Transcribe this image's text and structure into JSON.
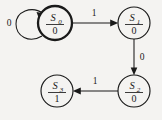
{
  "diagram": {
    "kind": "state-transition-diagram",
    "background_color": "#f4f3f1",
    "line_color": "#1a1a1a",
    "states": [
      {
        "id": "S0",
        "name": "S",
        "subscript": "0",
        "output": "0",
        "cx": 55,
        "cy": 23,
        "r": 17,
        "emphasis": "bold"
      },
      {
        "id": "S1",
        "name": "S",
        "subscript": "1",
        "output": "0",
        "cx": 134,
        "cy": 23,
        "r": 16,
        "emphasis": "normal"
      },
      {
        "id": "S2",
        "name": "S",
        "subscript": "2",
        "output": "0",
        "cx": 134,
        "cy": 91,
        "r": 16,
        "emphasis": "normal"
      },
      {
        "id": "S3",
        "name": "S",
        "subscript": "3",
        "output": "1",
        "cx": 57,
        "cy": 91,
        "r": 16,
        "emphasis": "normal"
      }
    ],
    "transitions": [
      {
        "id": "t-s0-s0",
        "from": "S0",
        "to": "S0",
        "label": "0",
        "label_x": 9,
        "label_y": 26,
        "shape": "self-loop-left"
      },
      {
        "id": "t-s0-s1",
        "from": "S0",
        "to": "S1",
        "label": "1",
        "label_x": 94,
        "label_y": 16,
        "shape": "horizontal-right"
      },
      {
        "id": "t-s1-s2",
        "from": "S1",
        "to": "S2",
        "label": "0",
        "label_x": 142,
        "label_y": 60,
        "shape": "vertical-down"
      },
      {
        "id": "t-s2-s3",
        "from": "S2",
        "to": "S3",
        "label": "1",
        "label_x": 95,
        "label_y": 84,
        "shape": "horizontal-left"
      }
    ]
  }
}
